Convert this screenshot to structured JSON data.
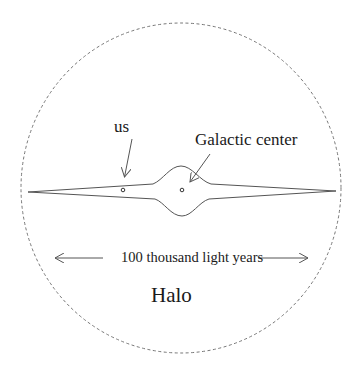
{
  "diagram": {
    "labels": {
      "us": "us",
      "galactic_center": "Galactic center",
      "scale": "100 thousand light years",
      "halo": "Halo"
    },
    "elements": [
      {
        "id": "halo-boundary",
        "shape": "dashed-ellipse"
      },
      {
        "id": "galactic-disk",
        "shape": "thin-lens"
      },
      {
        "id": "central-bulge",
        "shape": "bump"
      },
      {
        "id": "sun-marker",
        "shape": "small-circle"
      },
      {
        "id": "center-marker",
        "shape": "small-circle"
      },
      {
        "id": "us-arrow",
        "shape": "arrow"
      },
      {
        "id": "center-arrow",
        "shape": "arrow"
      },
      {
        "id": "scale-arrow-left",
        "shape": "arrow"
      },
      {
        "id": "scale-arrow-right",
        "shape": "arrow"
      }
    ],
    "colors": {
      "stroke": "#555555",
      "text": "#1a1a1a",
      "background": "#ffffff"
    }
  }
}
